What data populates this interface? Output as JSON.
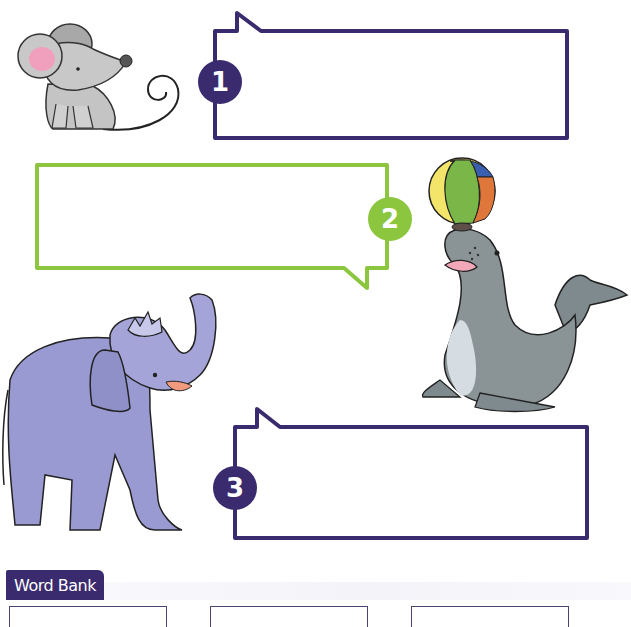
{
  "worksheet": {
    "bubbles": [
      {
        "number": "1",
        "color": "#3a2a6e",
        "answer": ""
      },
      {
        "number": "2",
        "color": "#8cc63f",
        "answer": ""
      },
      {
        "number": "3",
        "color": "#3a2a6e",
        "answer": ""
      }
    ],
    "illustrations": [
      {
        "name": "mouse"
      },
      {
        "name": "seal-with-ball"
      },
      {
        "name": "elephant"
      }
    ],
    "word_bank": {
      "title": "Word Bank",
      "words": [
        "",
        "",
        ""
      ]
    }
  }
}
